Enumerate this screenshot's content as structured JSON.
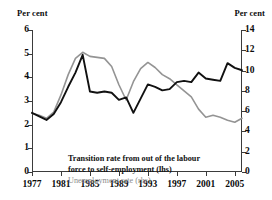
{
  "axes": {
    "left_unit": "Per cent",
    "right_unit": "Per cent",
    "left_ticks": [
      "0",
      "1",
      "2",
      "3",
      "4",
      "5",
      "6"
    ],
    "right_ticks": [
      "0",
      "2",
      "4",
      "6",
      "8",
      "10",
      "12",
      "14"
    ],
    "x_ticks": [
      "1977",
      "1981",
      "1985",
      "1989",
      "1993",
      "1997",
      "2001",
      "2005"
    ]
  },
  "legend": {
    "black_line_1": "Transition rate from out of the labour",
    "black_line_2": "force to self-employment (lhs)",
    "grey_line": "Unemployment rate (rhs)"
  },
  "colors": {
    "black_series": "#111111",
    "grey_series": "#949494",
    "axis": "#3b3b3b",
    "background": "#ffffff"
  },
  "chart_data": {
    "type": "line",
    "title": "",
    "xlabel": "",
    "ylabel": "Per cent",
    "y2label": "Per cent",
    "xlim": [
      1977,
      2006
    ],
    "ylim": [
      0,
      6
    ],
    "y2lim": [
      0,
      14
    ],
    "grid": false,
    "legend_position": "inside-lower-left",
    "x": [
      1977,
      1978,
      1979,
      1980,
      1981,
      1982,
      1983,
      1984,
      1985,
      1986,
      1987,
      1988,
      1989,
      1990,
      1991,
      1992,
      1993,
      1994,
      1995,
      1996,
      1997,
      1998,
      1999,
      2000,
      2001,
      2002,
      2003,
      2004,
      2005,
      2006
    ],
    "series": [
      {
        "name": "Transition rate from out of the labour force to self-employment (lhs)",
        "axis": "left",
        "color": "#111111",
        "values": [
          2.5,
          2.35,
          2.2,
          2.45,
          2.95,
          3.6,
          4.2,
          4.95,
          3.4,
          3.35,
          3.4,
          3.35,
          3.05,
          3.15,
          2.5,
          3.1,
          3.7,
          3.6,
          3.45,
          3.5,
          3.8,
          3.85,
          3.8,
          4.2,
          3.95,
          3.9,
          3.85,
          4.6,
          4.4,
          4.3
        ]
      },
      {
        "name": "Unemployment rate (rhs)",
        "axis": "right",
        "color": "#949494",
        "values": [
          5.8,
          5.6,
          5.3,
          5.9,
          7.6,
          9.6,
          11.2,
          11.8,
          11.4,
          11.3,
          11.2,
          10.4,
          8.6,
          7.1,
          8.9,
          10.2,
          10.8,
          10.3,
          9.6,
          9.2,
          8.6,
          8.0,
          7.4,
          6.2,
          5.4,
          5.6,
          5.4,
          5.1,
          4.9,
          5.3
        ]
      }
    ]
  }
}
